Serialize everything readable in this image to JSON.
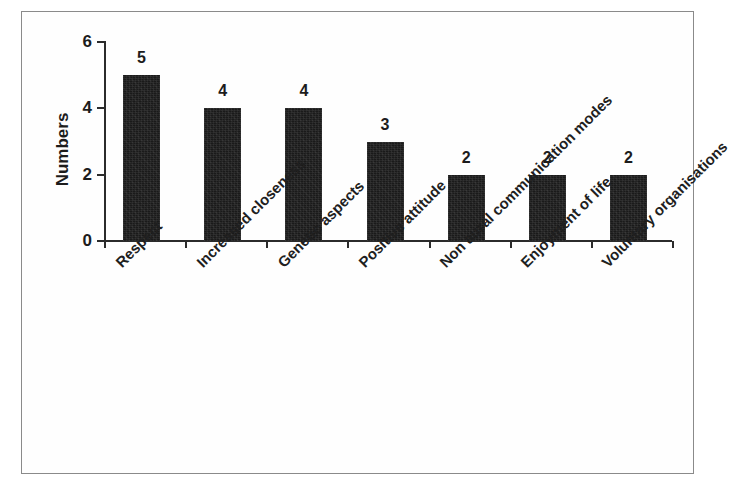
{
  "figure": {
    "frame_color": "#8a8a8a",
    "background_color": "#ffffff",
    "bar_color": "#1a1a1a",
    "axis_color": "#2b2b2b"
  },
  "chart_data": {
    "type": "bar",
    "title": "",
    "subtitle": "",
    "xlabel": "",
    "ylabel": "Numbers",
    "ylim": [
      0,
      6
    ],
    "ytick_labels": [
      "0",
      "2",
      "4",
      "6"
    ],
    "ytick_values": [
      0,
      2,
      4,
      6
    ],
    "grid": false,
    "legend": false,
    "legend_position": "none",
    "label_rotation_deg": -45,
    "categories": [
      "Respect",
      "Increased closeness",
      "Genetic aspects",
      "Positive attitude",
      "Non aural communication modes",
      "Enjoyment of life",
      "Voluntary organisations"
    ],
    "values": [
      5,
      4,
      4,
      3,
      2,
      2,
      2
    ],
    "value_labels": [
      "5",
      "4",
      "4",
      "3",
      "2",
      "2",
      "2"
    ]
  }
}
